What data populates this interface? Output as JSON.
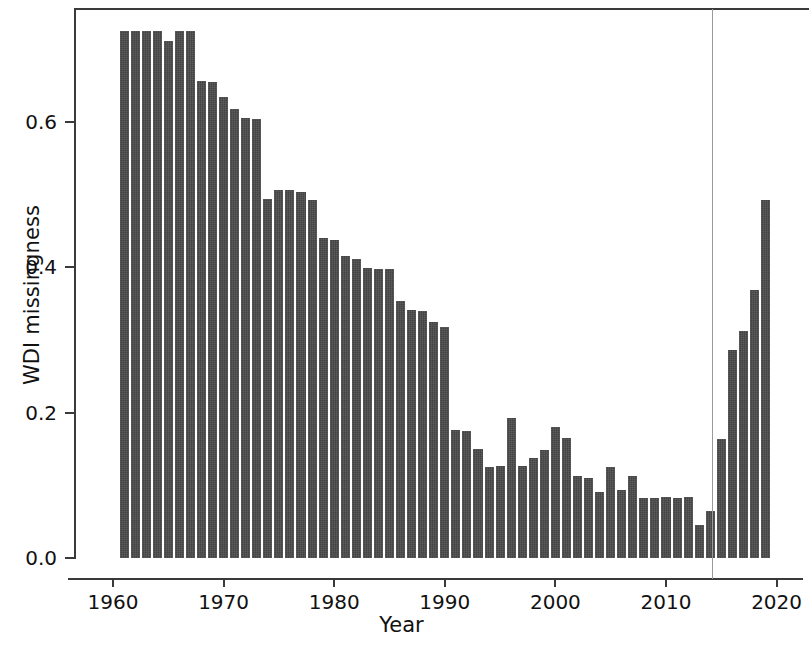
{
  "chart_data": {
    "type": "bar",
    "title": "",
    "xlabel": "Year",
    "ylabel": "WDI missingness",
    "xlim": [
      1959.5,
      2020.5
    ],
    "ylim": [
      0.0,
      0.74
    ],
    "grid": false,
    "legend": null,
    "bar_color": "#4b4b4b",
    "xticks": [
      1960,
      1970,
      1980,
      1990,
      2000,
      2010,
      2020
    ],
    "xtick_labels": [
      "1960",
      "1970",
      "1980",
      "1990",
      "2000",
      "2010",
      "2020"
    ],
    "yticks": [
      0.0,
      0.2,
      0.4,
      0.6
    ],
    "ytick_labels": [
      "0.0",
      "0.2",
      "0.4",
      "0.6"
    ],
    "annotations": [
      {
        "type": "vertical-line",
        "name": "reference-line",
        "x": 2014.2,
        "color": "#9a9a9a",
        "style": "solid"
      }
    ],
    "categories": [
      1961,
      1962,
      1963,
      1964,
      1965,
      1966,
      1967,
      1968,
      1969,
      1970,
      1971,
      1972,
      1973,
      1974,
      1975,
      1976,
      1977,
      1978,
      1979,
      1980,
      1981,
      1982,
      1983,
      1984,
      1985,
      1986,
      1987,
      1988,
      1989,
      1990,
      1991,
      1992,
      1993,
      1994,
      1995,
      1996,
      1997,
      1998,
      1999,
      2000,
      2001,
      2002,
      2003,
      2004,
      2005,
      2006,
      2007,
      2008,
      2009,
      2010,
      2011,
      2012,
      2013,
      2014,
      2015,
      2016,
      2017,
      2018,
      2019
    ],
    "values": [
      0.725,
      0.725,
      0.725,
      0.725,
      0.712,
      0.725,
      0.725,
      0.656,
      0.655,
      0.635,
      0.618,
      0.605,
      0.604,
      0.494,
      0.506,
      0.506,
      0.503,
      0.493,
      0.44,
      0.438,
      0.416,
      0.412,
      0.399,
      0.398,
      0.398,
      0.353,
      0.341,
      0.34,
      0.325,
      0.318,
      0.176,
      0.175,
      0.15,
      0.125,
      0.126,
      0.192,
      0.126,
      0.137,
      0.149,
      0.18,
      0.165,
      0.113,
      0.11,
      0.091,
      0.125,
      0.094,
      0.113,
      0.083,
      0.083,
      0.084,
      0.083,
      0.084,
      0.046,
      0.065,
      0.164,
      0.286,
      0.313,
      0.369,
      0.492
    ]
  }
}
